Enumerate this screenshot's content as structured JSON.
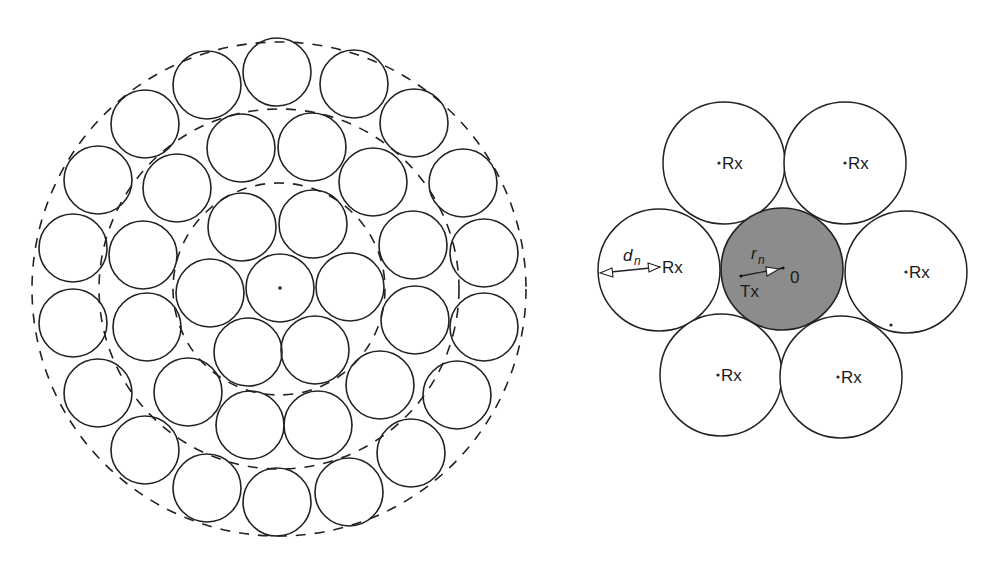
{
  "colors": {
    "stroke": "#222222",
    "background": "#ffffff",
    "tx_fill": "#8c8c8c"
  },
  "left_figure": {
    "center": [
      279,
      289
    ],
    "circle_radius": 34,
    "dashed_rings": [
      106,
      180,
      247
    ],
    "circles": [
      [
        280,
        288
      ],
      [
        242,
        227
      ],
      [
        313,
        224
      ],
      [
        350,
        287
      ],
      [
        315,
        350
      ],
      [
        248,
        352
      ],
      [
        210,
        293
      ],
      [
        241,
        148
      ],
      [
        312,
        147
      ],
      [
        373,
        182
      ],
      [
        413,
        245
      ],
      [
        415,
        320
      ],
      [
        380,
        385
      ],
      [
        318,
        425
      ],
      [
        250,
        425
      ],
      [
        188,
        392
      ],
      [
        147,
        327
      ],
      [
        143,
        255
      ],
      [
        177,
        188
      ],
      [
        207,
        85
      ],
      [
        277,
        72
      ],
      [
        354,
        84
      ],
      [
        414,
        123
      ],
      [
        463,
        183
      ],
      [
        484,
        253
      ],
      [
        484,
        327
      ],
      [
        457,
        395
      ],
      [
        411,
        453
      ],
      [
        349,
        492
      ],
      [
        277,
        502
      ],
      [
        207,
        488
      ],
      [
        145,
        450
      ],
      [
        98,
        393
      ],
      [
        73,
        323
      ],
      [
        73,
        248
      ],
      [
        98,
        180
      ],
      [
        145,
        124
      ]
    ]
  },
  "right_figure": {
    "circle_radius": 61,
    "tx": {
      "center": [
        782,
        269
      ],
      "label": "Tx",
      "origin_label": "0",
      "radius_label": "r",
      "radius_subscript": "n"
    },
    "rx_label": "Rx",
    "distance_label": "d",
    "distance_subscript": "n",
    "rx_circles": [
      {
        "center": [
          724,
          163
        ],
        "label": "Rx"
      },
      {
        "center": [
          845,
          163
        ],
        "label": "Rx"
      },
      {
        "center": [
          659,
          270
        ],
        "label": "Rx"
      },
      {
        "center": [
          906,
          272
        ],
        "label": "Rx"
      },
      {
        "center": [
          721,
          375
        ],
        "label": "Rx"
      },
      {
        "center": [
          841,
          377
        ],
        "label": "Rx"
      }
    ]
  }
}
